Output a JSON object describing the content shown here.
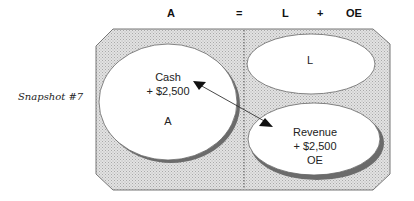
{
  "equation": {
    "assets": "A",
    "equals": "=",
    "liabilities": "L",
    "plus": "+",
    "owners_equity": "OE"
  },
  "snapshot_label": "Snapshot #7",
  "circles": {
    "assets": {
      "line1": "Cash",
      "line2": "+ $2,500",
      "line3": "A"
    },
    "liabilities": {
      "line1": "L"
    },
    "owners_equity": {
      "line1": "Revenue",
      "line2": "+ $2,500",
      "line3": "OE"
    }
  },
  "arrow": {
    "from": "Revenue",
    "to": "Cash",
    "bidirectional": true
  },
  "colors": {
    "panel_fill": "#d6d6d6",
    "shadow": "#6b6b6b",
    "outline": "#777777"
  }
}
